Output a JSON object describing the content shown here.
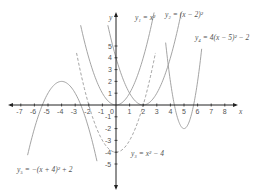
{
  "chart_data": {
    "type": "line",
    "title": "",
    "xlabel": "x",
    "ylabel": "y",
    "xlim": [
      -7.5,
      8.6
    ],
    "ylim": [
      -7,
      7.8
    ],
    "grid": false,
    "x_ticks": [
      -7,
      -6,
      -5,
      -4,
      -3,
      -2,
      -1,
      0,
      1,
      2,
      3,
      4,
      5,
      6,
      7,
      8
    ],
    "y_ticks": [
      -5,
      -4,
      -3,
      -2,
      -1,
      1,
      2,
      3,
      4,
      5
    ],
    "series": [
      {
        "name": "y1",
        "label": "y₁ = x²",
        "equation": "x^2",
        "a": 1,
        "h": 0,
        "k": 0,
        "x_range": [
          -2.6,
          2.8
        ],
        "style": "solid",
        "label_pos": [
          135,
          20
        ]
      },
      {
        "name": "y2",
        "label": "y₂ = (x − 2)²",
        "equation": "(x-2)^2",
        "a": 1,
        "h": 2,
        "k": 0,
        "x_range": [
          -0.6,
          4.8
        ],
        "style": "solid",
        "label_pos": [
          165,
          17
        ]
      },
      {
        "name": "y3",
        "label": "y₃ = x² − 4",
        "equation": "x^2-4",
        "a": 1,
        "h": 0,
        "k": -4,
        "x_range": [
          -2.9,
          2.9
        ],
        "style": "dashed",
        "label_pos": [
          131,
          156
        ]
      },
      {
        "name": "y4",
        "label": "y₄ = 4(x − 5)² − 2",
        "equation": "4(x-5)^2-2",
        "a": 4,
        "h": 5,
        "k": -2,
        "x_range": [
          3.65,
          6.3
        ],
        "style": "solid",
        "label_pos": [
          195,
          40
        ]
      },
      {
        "name": "y5",
        "label": "y₅ = −(x + 4)² + 2",
        "equation": "-(x+4)^2+2",
        "a": -1,
        "h": -4,
        "k": 2,
        "x_range": [
          -6.5,
          -1.4
        ],
        "style": "solid",
        "label_pos": [
          17,
          172
        ]
      }
    ]
  },
  "axes": {
    "x_axis_label": "x",
    "y_axis_label": "y",
    "origin_label": "0"
  }
}
